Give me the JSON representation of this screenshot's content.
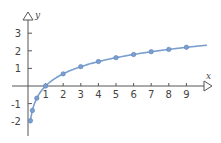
{
  "chart_data": {
    "type": "line",
    "title": "",
    "xlabel": "x",
    "ylabel": "y",
    "function": "y = ln(x)",
    "x_ticks": [
      1,
      2,
      3,
      4,
      5,
      6,
      7,
      8,
      9
    ],
    "y_ticks": [
      -2,
      -1,
      1,
      2,
      3
    ],
    "xlim": [
      -1,
      10.4
    ],
    "ylim": [
      -2.6,
      3.8
    ],
    "grid": false,
    "legend": null,
    "series": [
      {
        "name": "ln(x)",
        "color": "#7a9fd0",
        "points": [
          {
            "x": 0.14,
            "y": -1.97
          },
          {
            "x": 0.25,
            "y": -1.39
          },
          {
            "x": 0.5,
            "y": -0.69
          },
          {
            "x": 1,
            "y": 0
          },
          {
            "x": 2,
            "y": 0.69
          },
          {
            "x": 3,
            "y": 1.1
          },
          {
            "x": 4,
            "y": 1.39
          },
          {
            "x": 5,
            "y": 1.61
          },
          {
            "x": 6,
            "y": 1.79
          },
          {
            "x": 7,
            "y": 1.95
          },
          {
            "x": 8,
            "y": 2.08
          },
          {
            "x": 9,
            "y": 2.2
          }
        ]
      }
    ]
  },
  "axes": {
    "x_label": "x",
    "y_label": "y"
  }
}
